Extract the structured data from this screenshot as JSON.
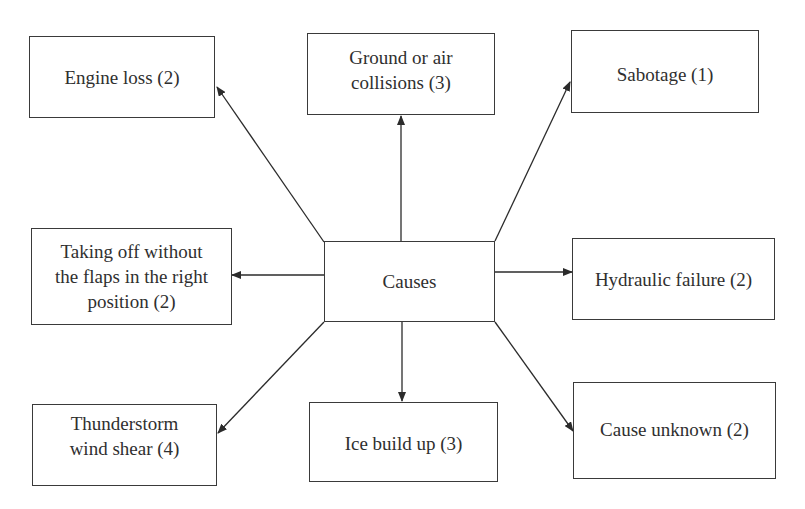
{
  "diagram": {
    "type": "radial-cause-diagram",
    "center": {
      "label": "Causes"
    },
    "causes": [
      {
        "label": "Engine loss (2)",
        "count": 2
      },
      {
        "label": "Ground or air\ncollisions (3)",
        "count": 3
      },
      {
        "label": "Sabotage (1)",
        "count": 1
      },
      {
        "label": "Taking off without\nthe flaps in the right\nposition (2)",
        "count": 2
      },
      {
        "label": "Hydraulic failure (2)",
        "count": 2
      },
      {
        "label": "Thunderstorm\nwind shear (4)",
        "count": 4
      },
      {
        "label": "Ice build up (3)",
        "count": 3
      },
      {
        "label": "Cause unknown (2)",
        "count": 2
      }
    ],
    "edges": [
      {
        "from": "Causes",
        "to": "Engine loss (2)"
      },
      {
        "from": "Causes",
        "to": "Ground or air collisions (3)"
      },
      {
        "from": "Causes",
        "to": "Sabotage (1)"
      },
      {
        "from": "Causes",
        "to": "Taking off without the flaps in the right position (2)"
      },
      {
        "from": "Causes",
        "to": "Hydraulic failure (2)"
      },
      {
        "from": "Causes",
        "to": "Thunderstorm wind shear (4)"
      },
      {
        "from": "Causes",
        "to": "Ice build up (3)"
      },
      {
        "from": "Causes",
        "to": "Cause unknown (2)"
      }
    ],
    "colors": {
      "line": "#2b2b2b",
      "box_border": "#3a3a3a",
      "text": "#2f2f2f",
      "background": "#ffffff"
    }
  }
}
